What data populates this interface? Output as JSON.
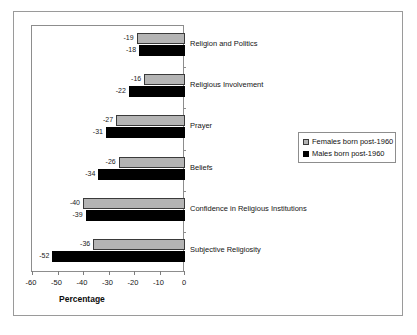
{
  "chart_data": {
    "type": "bar",
    "orientation": "horizontal",
    "title": "",
    "xlabel": "Percentage",
    "ylabel": "",
    "xlim": [
      -60,
      0
    ],
    "xticks": [
      "-60",
      "-50",
      "-40",
      "-30",
      "-20",
      "-10",
      "0"
    ],
    "xtick_values": [
      -60,
      -50,
      -40,
      -30,
      -20,
      -10,
      0
    ],
    "grid": false,
    "legend_position": "right",
    "categories": [
      "Religion and Politics",
      "Religious Involvement",
      "Prayer",
      "Beliefs",
      "Confidence in Religious Institutions",
      "Subjective Religiosity"
    ],
    "series": [
      {
        "name": "Females born post-1960",
        "color": "#b4b4b4",
        "values": [
          -19,
          -16,
          -27,
          -26,
          -40,
          -36
        ],
        "labels": [
          "-19",
          "-16",
          "-27",
          "-26",
          "-40",
          "-36"
        ]
      },
      {
        "name": "Males born post-1960",
        "color": "#000000",
        "values": [
          -18,
          -22,
          -31,
          -34,
          -39,
          -52
        ],
        "labels": [
          "-18",
          "-22",
          "-31",
          "-34",
          "-39",
          "-52"
        ]
      }
    ]
  },
  "legend": {
    "items": [
      {
        "label": "Females born post-1960",
        "swatch": "female"
      },
      {
        "label": "Males born post-1960",
        "swatch": "male"
      }
    ]
  },
  "axis": {
    "x_title": "Percentage"
  }
}
